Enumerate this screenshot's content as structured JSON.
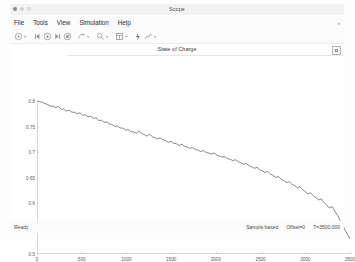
{
  "window": {
    "title": "Scope",
    "traffic_lights": [
      "close",
      "minimize",
      "maximize"
    ]
  },
  "menubar": {
    "items": [
      {
        "label": "File",
        "name": "menu-file"
      },
      {
        "label": "Tools",
        "name": "menu-tools"
      },
      {
        "label": "View",
        "name": "menu-view"
      },
      {
        "label": "Simulation",
        "name": "menu-simulation"
      },
      {
        "label": "Help",
        "name": "menu-help"
      }
    ],
    "overflow": "»"
  },
  "toolbar": {
    "items": [
      {
        "name": "print-icon",
        "kind": "print",
        "dropdown": true
      },
      {
        "name": "rewind-icon",
        "kind": "rewind",
        "dropdown": false
      },
      {
        "name": "run-icon",
        "kind": "run",
        "dropdown": false
      },
      {
        "name": "step-forward-icon",
        "kind": "step",
        "dropdown": false
      },
      {
        "name": "stop-icon",
        "kind": "stop",
        "dropdown": false
      },
      {
        "name": "data-cursor-icon",
        "kind": "cursor",
        "dropdown": true
      },
      {
        "name": "zoom-icon",
        "kind": "zoom",
        "dropdown": true
      },
      {
        "name": "layout-icon",
        "kind": "layout",
        "dropdown": true
      },
      {
        "name": "highlight-signal-icon",
        "kind": "highlight",
        "dropdown": false
      },
      {
        "name": "measurements-icon",
        "kind": "measure",
        "dropdown": true
      }
    ]
  },
  "plot": {
    "title": "State of Charge",
    "expand_button": "panel-expand-button"
  },
  "statusbar": {
    "ready": "Ready",
    "frame_mode": "Sample based",
    "offset": "Offset=0",
    "time": "T=3500.000"
  },
  "chart_data": {
    "type": "line",
    "title": "State of Charge",
    "xlabel": "",
    "ylabel": "",
    "xlim": [
      0,
      3500
    ],
    "ylim": [
      0.5,
      0.8
    ],
    "grid": false,
    "legend": null,
    "line_color": "#555555",
    "line_width": 0.7,
    "xticks": [
      0,
      500,
      1000,
      1500,
      2000,
      2500,
      3000,
      3500
    ],
    "xticklabels": [
      "0",
      "500",
      "1000",
      "1500",
      "2000",
      "2500",
      "3000",
      "3500"
    ],
    "yticks": [
      0.5,
      0.55,
      0.6,
      0.65,
      0.7,
      0.75,
      0.8
    ],
    "yticklabels": [
      "0.5",
      "0.55",
      "0.6",
      "0.65",
      "0.7",
      "0.75",
      "0.8"
    ],
    "series": [
      {
        "name": "State of Charge",
        "x": [
          0,
          30,
          60,
          90,
          120,
          150,
          180,
          210,
          240,
          270,
          300,
          330,
          360,
          390,
          420,
          450,
          480,
          510,
          540,
          570,
          600,
          630,
          660,
          690,
          720,
          750,
          780,
          810,
          840,
          870,
          900,
          930,
          960,
          990,
          1020,
          1050,
          1080,
          1110,
          1140,
          1170,
          1200,
          1230,
          1260,
          1290,
          1320,
          1350,
          1380,
          1410,
          1440,
          1470,
          1500,
          1530,
          1560,
          1590,
          1620,
          1650,
          1680,
          1710,
          1740,
          1770,
          1800,
          1830,
          1860,
          1890,
          1920,
          1950,
          1980,
          2010,
          2040,
          2070,
          2100,
          2130,
          2160,
          2190,
          2220,
          2250,
          2280,
          2310,
          2340,
          2370,
          2400,
          2430,
          2460,
          2490,
          2520,
          2550,
          2580,
          2610,
          2640,
          2670,
          2700,
          2730,
          2760,
          2790,
          2820,
          2850,
          2880,
          2910,
          2940,
          2970,
          3000,
          3030,
          3060,
          3090,
          3120,
          3150,
          3180,
          3210,
          3240,
          3270,
          3300,
          3330,
          3360,
          3390,
          3420,
          3450,
          3480,
          3500
        ],
        "y": [
          0.8,
          0.799,
          0.797,
          0.795,
          0.793,
          0.79,
          0.79,
          0.787,
          0.789,
          0.784,
          0.784,
          0.78,
          0.782,
          0.778,
          0.778,
          0.775,
          0.777,
          0.772,
          0.773,
          0.769,
          0.77,
          0.766,
          0.767,
          0.762,
          0.762,
          0.758,
          0.759,
          0.755,
          0.754,
          0.75,
          0.751,
          0.747,
          0.747,
          0.743,
          0.744,
          0.74,
          0.739,
          0.737,
          0.741,
          0.736,
          0.734,
          0.731,
          0.735,
          0.73,
          0.728,
          0.726,
          0.728,
          0.724,
          0.722,
          0.719,
          0.721,
          0.717,
          0.716,
          0.713,
          0.715,
          0.711,
          0.71,
          0.707,
          0.709,
          0.705,
          0.704,
          0.701,
          0.703,
          0.699,
          0.698,
          0.696,
          0.698,
          0.694,
          0.692,
          0.69,
          0.691,
          0.687,
          0.686,
          0.683,
          0.685,
          0.681,
          0.679,
          0.676,
          0.678,
          0.673,
          0.671,
          0.668,
          0.67,
          0.665,
          0.663,
          0.66,
          0.662,
          0.657,
          0.654,
          0.65,
          0.652,
          0.647,
          0.644,
          0.64,
          0.642,
          0.637,
          0.634,
          0.63,
          0.632,
          0.626,
          0.622,
          0.618,
          0.62,
          0.614,
          0.61,
          0.606,
          0.608,
          0.601,
          0.596,
          0.59,
          0.593,
          0.584,
          0.576,
          0.566,
          0.556,
          0.545,
          0.536,
          0.53
        ]
      }
    ]
  }
}
